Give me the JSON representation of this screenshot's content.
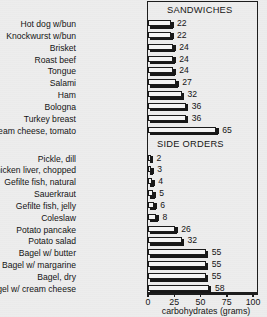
{
  "chart_data": {
    "type": "bar",
    "orientation": "horizontal",
    "title": "",
    "xlabel": "carbohydrates (grams)",
    "ylabel": "",
    "xlim": [
      0,
      100
    ],
    "xticks": [
      0,
      25,
      50,
      75,
      100
    ],
    "grid": false,
    "legend": null,
    "groups": [
      {
        "name": "SANDWICHES",
        "categories": [
          "Hot dog w/bun",
          "Knockwurst w/bun",
          "Brisket",
          "Roast beef",
          "Tongue",
          "Salami",
          "Ham",
          "Bologna",
          "Turkey breast",
          "Lox, bagel, cream cheese, tomato"
        ],
        "values": [
          22,
          22,
          24,
          24,
          24,
          27,
          32,
          36,
          36,
          65
        ]
      },
      {
        "name": "SIDE ORDERS",
        "categories": [
          "Pickle, dill",
          "Chicken liver, chopped",
          "Gefilte fish, natural",
          "Sauerkraut",
          "Gefilte fish, jelly",
          "Coleslaw",
          "Potato pancake",
          "Potato salad",
          "Bagel w/ butter",
          "Bagel w/ margarine",
          "Bagel, dry",
          "Bagel w/ cream cheese"
        ],
        "values": [
          2,
          3,
          4,
          5,
          6,
          8,
          26,
          32,
          55,
          55,
          55,
          58
        ]
      }
    ]
  },
  "colors": {
    "background": "#ededed",
    "ink": "#1b1b1b",
    "bar_fill": "#f4f4f4",
    "bar_shadow": "#181818"
  }
}
